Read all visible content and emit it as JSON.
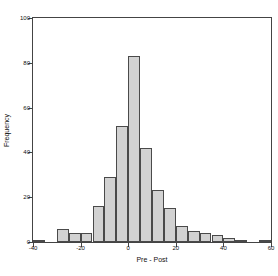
{
  "chart_data": {
    "type": "bar",
    "title": "",
    "subtitle": "",
    "xlabel": "Pre - Post",
    "ylabel": "Frequency",
    "xlim": [
      -40,
      60
    ],
    "ylim": [
      0,
      100
    ],
    "xticks": [
      -40,
      -20,
      0,
      20,
      40,
      60
    ],
    "xtick_labels": [
      "-40",
      "-20",
      "0",
      "20",
      "40",
      "60"
    ],
    "yticks": [
      0,
      20,
      40,
      60,
      80,
      100
    ],
    "ytick_labels": [
      "0",
      "20",
      "40",
      "60",
      "80",
      "100"
    ],
    "grid": false,
    "legend": false,
    "bin_width": 5,
    "bin_edges": [
      -40,
      -35,
      -30,
      -25,
      -20,
      -15,
      -10,
      -5,
      0,
      5,
      10,
      15,
      20,
      25,
      30,
      35,
      40,
      45,
      50,
      55,
      60
    ],
    "categories": [
      "-40 to -35",
      "-35 to -30",
      "-30 to -25",
      "-25 to -20",
      "-20 to -15",
      "-15 to -10",
      "-10 to -5",
      "-5 to 0",
      "0 to 5",
      "5 to 10",
      "10 to 15",
      "15 to 20",
      "20 to 25",
      "25 to 30",
      "30 to 35",
      "35 to 40",
      "40 to 45",
      "45 to 50",
      "50 to 55",
      "55 to 60"
    ],
    "values": [
      1,
      0,
      6,
      4,
      4,
      16,
      29,
      52,
      83,
      42,
      23,
      15,
      7,
      5,
      4,
      3,
      2,
      1,
      0,
      1
    ],
    "bar_fill_color": "#d2d2d2",
    "bar_edge_color": "#4a4a4a",
    "frame_color": "#444444",
    "background_color": "#ffffff"
  }
}
